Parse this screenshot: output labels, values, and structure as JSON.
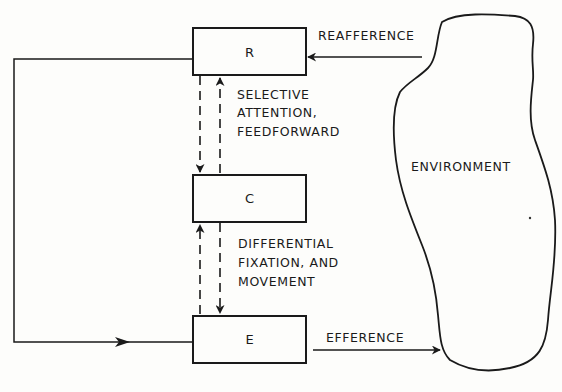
{
  "diagram": {
    "nodes": [
      {
        "id": "R",
        "label": "R"
      },
      {
        "id": "C",
        "label": "C"
      },
      {
        "id": "E",
        "label": "E"
      },
      {
        "id": "environment",
        "label": "ENVIRONMENT"
      }
    ],
    "labels": {
      "reafference": "REAFFERENCE",
      "efference": "EFFERENCE",
      "rc_line1": "SELECTIVE",
      "rc_line2": "ATTENTION,",
      "rc_line3": "FEEDFORWARD",
      "ce_line1": "DIFFERENTIAL",
      "ce_line2": "FIXATION, AND",
      "ce_line3": "MOVEMENT"
    },
    "edges": [
      {
        "from": "environment",
        "to": "R",
        "label": "REAFFERENCE",
        "style": "solid"
      },
      {
        "from": "E",
        "to": "environment",
        "label": "EFFERENCE",
        "style": "solid"
      },
      {
        "from": "R",
        "to": "E",
        "label": "",
        "style": "solid",
        "route": "left loop"
      },
      {
        "from": "R",
        "to": "C",
        "label": "",
        "style": "dashed"
      },
      {
        "from": "C",
        "to": "R",
        "label": "SELECTIVE ATTENTION, FEEDFORWARD",
        "style": "dashed"
      },
      {
        "from": "E",
        "to": "C",
        "label": "",
        "style": "dashed"
      },
      {
        "from": "C",
        "to": "E",
        "label": "DIFFERENTIAL FIXATION, AND MOVEMENT",
        "style": "dashed"
      }
    ]
  }
}
